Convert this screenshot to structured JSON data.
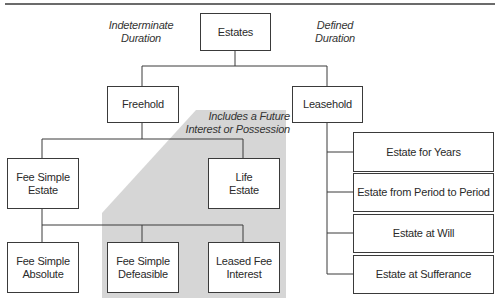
{
  "diagram": {
    "type": "hierarchy",
    "root": {
      "label": "Estates"
    },
    "annotations": {
      "left": "Indeterminate\nDuration",
      "right": "Defined\nDuration",
      "shaded_region": "Includes a Future\nInterest or Possession"
    },
    "freehold": {
      "label": "Freehold",
      "children": [
        {
          "label": "Fee Simple\nEstate"
        },
        {
          "label": "Life\nEstate"
        }
      ],
      "fee_simple_children": [
        {
          "label": "Fee Simple\nAbsolute"
        },
        {
          "label": "Fee Simple\nDefeasible"
        },
        {
          "label": "Leased Fee\nInterest"
        }
      ]
    },
    "leasehold": {
      "label": "Leasehold",
      "children": [
        {
          "label": "Estate for Years"
        },
        {
          "label": "Estate from Period to Period"
        },
        {
          "label": "Estate at Will"
        },
        {
          "label": "Estate at Sufferance"
        }
      ]
    },
    "colors": {
      "line": "#3a3a3a",
      "shade": "#d6d6d6",
      "box_fill": "#ffffff"
    }
  }
}
